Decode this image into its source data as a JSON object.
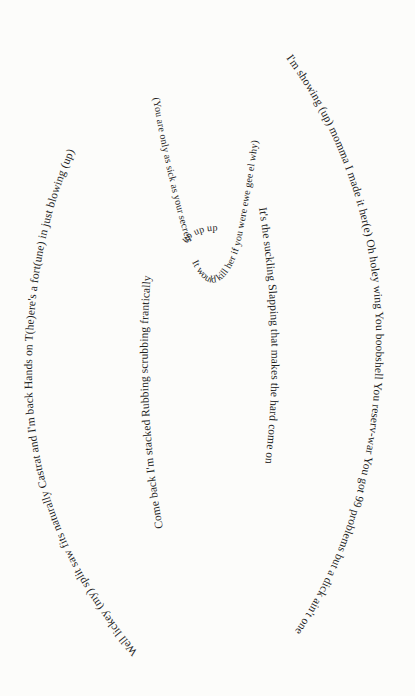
{
  "poem": {
    "outer_left": "Well lickey (my) split saw fits naturally   Castrat and I'm back   Hands on   T(he)ere's a fort(une) in just blowing (up)",
    "outer_right": "I'm showing (up) momma I made it her(e)   Oh holey wing   You boobshell   You reserv-war You got 99 problems but a dick ain't one",
    "inner_left": "Come back   I'm stacked   Rubbing   scrubbing frantically",
    "inner_right": "It's the suckling   Slapping that makes the hard come on",
    "center_left": "(You are only as sick as your secrets",
    "center_bottom": "It would kill her if you were ewe gee el why)",
    "center_up": "up up up"
  },
  "colors": {
    "ink": "#1e1e1e",
    "paper": "#fcfcfa"
  }
}
